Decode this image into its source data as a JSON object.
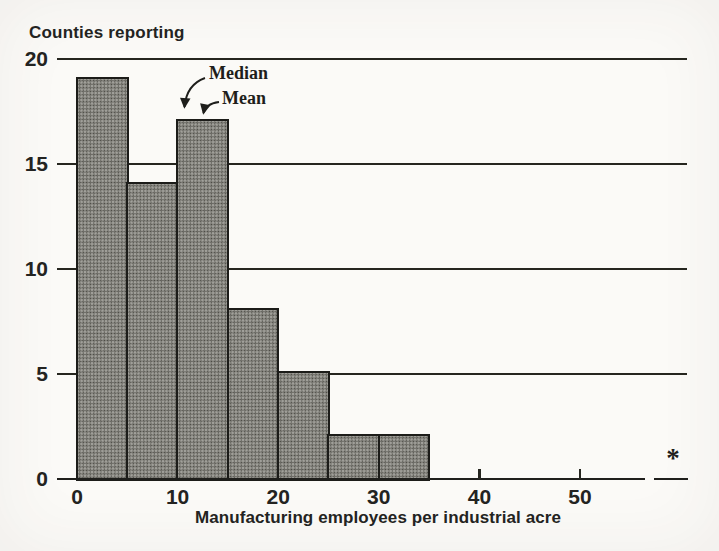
{
  "paper_color": "#fbfaf7",
  "ink_color": "#232321",
  "chart_data": {
    "type": "bar",
    "subtype": "histogram",
    "ylabel": "Counties reporting",
    "xlabel": "Manufacturing employees per industrial acre",
    "bins": [
      {
        "range": [
          0,
          5
        ],
        "count": 19
      },
      {
        "range": [
          5,
          10
        ],
        "count": 14
      },
      {
        "range": [
          10,
          15
        ],
        "count": 17
      },
      {
        "range": [
          15,
          20
        ],
        "count": 8
      },
      {
        "range": [
          20,
          25
        ],
        "count": 5
      },
      {
        "range": [
          25,
          30
        ],
        "count": 2
      },
      {
        "range": [
          30,
          35
        ],
        "count": 2
      }
    ],
    "yticks": [
      0,
      5,
      10,
      15,
      20
    ],
    "xticks": [
      0,
      10,
      20,
      30,
      40,
      50
    ],
    "ylim": [
      0,
      20
    ],
    "xlim": [
      0,
      57
    ],
    "gridlines_y": [
      5,
      10,
      15,
      20
    ],
    "grid": "horizontal",
    "legend": "none",
    "bar_fill": "halftone-dot-shading",
    "annotations": [
      {
        "label": "Median",
        "points_to_x": 11,
        "arrow": true
      },
      {
        "label": "Mean",
        "points_to_x": 13,
        "arrow": true
      }
    ],
    "outlier": {
      "symbol": "*",
      "axis_break": true,
      "beyond_x": 55
    }
  }
}
